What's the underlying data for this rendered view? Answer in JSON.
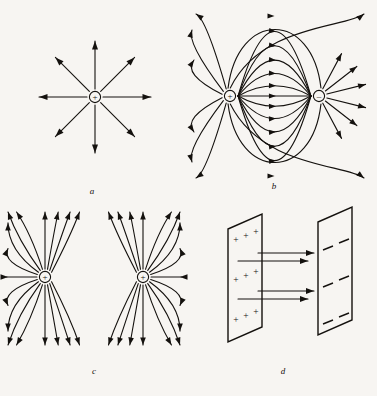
{
  "figure": {
    "caption_style": "italic-serif",
    "background_color": "#f7f5f2",
    "ink_color": "#14110e",
    "line_width": 1.1,
    "panels": [
      {
        "id": "a",
        "label": "a",
        "label_x": 92,
        "label_y": 194,
        "description": "isolated positive point charge with eight radial field lines",
        "charges": [
          {
            "sign": "+",
            "symbol": "+",
            "x": 95,
            "y": 97,
            "radius": 5.6
          }
        ],
        "radial_arrows": {
          "count": 8,
          "inner_radius": 8,
          "outer_radius": 56,
          "angles_deg": [
            0,
            45,
            90,
            135,
            180,
            225,
            270,
            315
          ]
        }
      },
      {
        "id": "b",
        "label": "b",
        "label_x": 274,
        "label_y": 189,
        "description": "electric dipole: equal and opposite charges with curved field lines from plus to minus",
        "charges": [
          {
            "sign": "+",
            "symbol": "+",
            "x": 230,
            "y": 96,
            "radius": 5.6
          },
          {
            "sign": "-",
            "symbol": "–",
            "x": 319,
            "y": 96,
            "radius": 5.6
          }
        ],
        "connecting_line_bulges": [
          0,
          10,
          22,
          35,
          49,
          63
        ],
        "outer_arc_count": 6
      },
      {
        "id": "c",
        "label": "c",
        "label_x": 94,
        "label_y": 374,
        "description": "two like positive charges; field lines repel and diverge between them",
        "charges": [
          {
            "sign": "+",
            "symbol": "+",
            "x": 45,
            "y": 277,
            "radius": 5.6
          },
          {
            "sign": "+",
            "symbol": "+",
            "x": 143,
            "y": 277,
            "radius": 5.6
          }
        ],
        "lines_per_charge": 16
      },
      {
        "id": "d",
        "label": "d",
        "label_x": 283,
        "label_y": 374,
        "description": "two oppositely charged parallel plates with uniform field arrows pointing from positive to negative plate",
        "left_plate": {
          "name": "positive-plate",
          "charge_symbol": "+",
          "rows": 3,
          "per_row": 3,
          "points": "228,229 262,214 262,327 228,342"
        },
        "right_plate": {
          "name": "negative-plate",
          "charge_symbol": "–",
          "rows": 3,
          "per_row": 2,
          "points": "318,222 352,207 352,320 318,335"
        },
        "field_arrows": [
          {
            "x1": 258,
            "y1": 253,
            "x2": 314,
            "y2": 253
          },
          {
            "x1": 238,
            "y1": 261,
            "x2": 308,
            "y2": 261
          },
          {
            "x1": 258,
            "y1": 291,
            "x2": 314,
            "y2": 291
          },
          {
            "x1": 238,
            "y1": 299,
            "x2": 308,
            "y2": 299
          }
        ]
      }
    ]
  }
}
